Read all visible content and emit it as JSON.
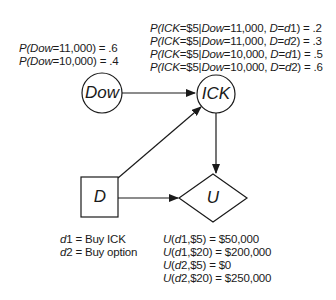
{
  "diagram": {
    "type": "influence-diagram",
    "nodes": [
      {
        "id": "dow",
        "label": "Dow",
        "shape": "circle",
        "kind": "chance"
      },
      {
        "id": "ick",
        "label": "ICK",
        "shape": "circle",
        "kind": "chance"
      },
      {
        "id": "d",
        "label": "D",
        "shape": "square",
        "kind": "decision"
      },
      {
        "id": "u",
        "label": "U",
        "shape": "diamond",
        "kind": "utility"
      }
    ],
    "edges": [
      {
        "from": "dow",
        "to": "ick"
      },
      {
        "from": "d",
        "to": "ick"
      },
      {
        "from": "ick",
        "to": "u"
      },
      {
        "from": "d",
        "to": "u"
      }
    ],
    "dow_probabilities": [
      {
        "p": "P(",
        "var": "Dow",
        "rest": "=11,000) = .6"
      },
      {
        "p": "P(",
        "var": "Dow",
        "rest": "=10,000) = .4"
      }
    ],
    "ick_probabilities": [
      {
        "a": "P(",
        "b": "ICK",
        "c": "=$5|",
        "d": "Dow",
        "e": "=11,000, ",
        "f": "D",
        "g": "=",
        "h": "d",
        "i": "1) = .2"
      },
      {
        "a": "P(",
        "b": "ICK",
        "c": "=$5|",
        "d": "Dow",
        "e": "=11,000, ",
        "f": "D",
        "g": "=",
        "h": "d",
        "i": "2) = .3"
      },
      {
        "a": "P(",
        "b": "ICK",
        "c": "=$5|",
        "d": "Dow",
        "e": "=10,000, ",
        "f": "D",
        "g": "=",
        "h": "d",
        "i": "1) = .5"
      },
      {
        "a": "P(",
        "b": "ICK",
        "c": "=$5|",
        "d": "Dow",
        "e": "=10,000, ",
        "f": "D",
        "g": "=",
        "h": "d",
        "i": "2) = .6"
      }
    ],
    "decisions": [
      {
        "var": "d",
        "num": "1",
        "text": " = Buy ICK"
      },
      {
        "var": "d",
        "num": "2",
        "text": " = Buy option"
      }
    ],
    "utilities": [
      {
        "u": "U",
        "open": "(",
        "d": "d",
        "rest": "1,$5) = $50,000"
      },
      {
        "u": "U",
        "open": "(",
        "d": "d",
        "rest": "1,$20) = $200,000"
      },
      {
        "u": "U",
        "open": "(",
        "d": "d",
        "rest": "2,$5) = $0"
      },
      {
        "u": "U",
        "open": "(",
        "d": "d",
        "rest": "2,$20) = $250,000"
      }
    ]
  }
}
